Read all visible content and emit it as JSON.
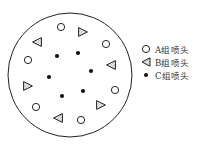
{
  "diagram": {
    "circle": {
      "cx": 70,
      "cy": 75,
      "r": 62,
      "stroke": "#222222"
    },
    "nozzles_a": [
      {
        "x": 61,
        "y": 27
      },
      {
        "x": 106,
        "y": 44
      },
      {
        "x": 28,
        "y": 60
      },
      {
        "x": 115,
        "y": 90
      },
      {
        "x": 36,
        "y": 107
      },
      {
        "x": 81,
        "y": 120
      }
    ],
    "nozzles_b": [
      {
        "x": 83,
        "y": 32,
        "dir": "right"
      },
      {
        "x": 37,
        "y": 42,
        "dir": "left"
      },
      {
        "x": 111,
        "y": 65,
        "dir": "left"
      },
      {
        "x": 28,
        "y": 86,
        "dir": "right"
      },
      {
        "x": 101,
        "y": 105,
        "dir": "right"
      },
      {
        "x": 58,
        "y": 118,
        "dir": "left"
      }
    ],
    "nozzles_c": [
      {
        "x": 57,
        "y": 56
      },
      {
        "x": 78,
        "y": 53
      },
      {
        "x": 91,
        "y": 71
      },
      {
        "x": 49,
        "y": 77
      },
      {
        "x": 62,
        "y": 96
      },
      {
        "x": 83,
        "y": 91
      }
    ]
  },
  "legend": {
    "items": [
      {
        "symbol": "open-circle",
        "label": "A组喷头"
      },
      {
        "symbol": "hatched-triangle",
        "label": "B组喷头"
      },
      {
        "symbol": "filled-dot",
        "label": "C组喷头"
      }
    ]
  },
  "colors": {
    "stroke": "#222222",
    "dot": "#111111",
    "hatch": "#888888"
  }
}
